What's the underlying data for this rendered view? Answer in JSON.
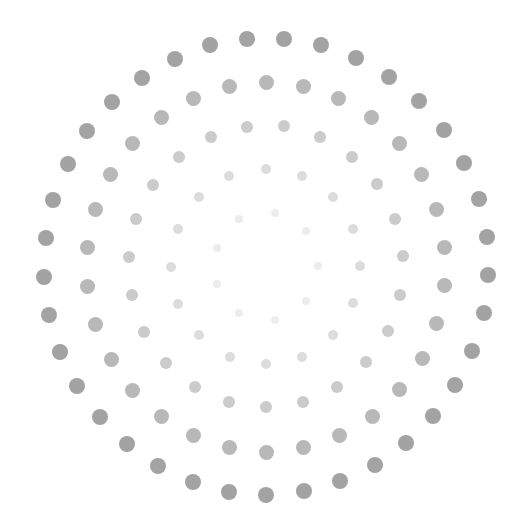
{
  "graphic": {
    "description": "Concentric rings of dots fading from dark gray (outer) to near-white (center)",
    "background": "#ffffff",
    "rings": [
      {
        "name": "ring-1",
        "size": 8,
        "color": "#ececec",
        "points": [
          [
            239,
            219
          ],
          [
            275,
            213
          ],
          [
            306,
            231
          ],
          [
            318,
            266
          ],
          [
            306,
            301
          ],
          [
            275,
            320
          ],
          [
            239,
            313
          ],
          [
            217,
            284
          ],
          [
            217,
            248
          ]
        ]
      },
      {
        "name": "ring-2",
        "size": 10,
        "color": "#dcdcdc",
        "points": [
          [
            229,
            176
          ],
          [
            266,
            169
          ],
          [
            302,
            176
          ],
          [
            333,
            197
          ],
          [
            353,
            229
          ],
          [
            360,
            266
          ],
          [
            353,
            303
          ],
          [
            333,
            335
          ],
          [
            302,
            357
          ],
          [
            266,
            364
          ],
          [
            230,
            357
          ],
          [
            199,
            335
          ],
          [
            178,
            304
          ],
          [
            171,
            267
          ],
          [
            178,
            229
          ],
          [
            199,
            197
          ]
        ]
      },
      {
        "name": "ring-3",
        "size": 12,
        "color": "#cbcbcb",
        "points": [
          [
            247,
            127
          ],
          [
            284,
            126
          ],
          [
            320,
            137
          ],
          [
            352,
            157
          ],
          [
            377,
            184
          ],
          [
            395,
            219
          ],
          [
            403,
            256
          ],
          [
            400,
            295
          ],
          [
            388,
            331
          ],
          [
            366,
            362
          ],
          [
            337,
            387
          ],
          [
            303,
            402
          ],
          [
            266,
            407
          ],
          [
            229,
            402
          ],
          [
            195,
            387
          ],
          [
            166,
            363
          ],
          [
            144,
            332
          ],
          [
            132,
            295
          ],
          [
            129,
            257
          ],
          [
            136,
            219
          ],
          [
            153,
            185
          ],
          [
            179,
            157
          ],
          [
            211,
            137
          ]
        ]
      },
      {
        "name": "ring-4",
        "size": 15,
        "color": "#b8b8b8",
        "points": [
          [
            229,
            86
          ],
          [
            266,
            82
          ],
          [
            303,
            86
          ],
          [
            338,
            98
          ],
          [
            371,
            117
          ],
          [
            399,
            143
          ],
          [
            421,
            174
          ],
          [
            436,
            209
          ],
          [
            444,
            247
          ],
          [
            444,
            285
          ],
          [
            436,
            323
          ],
          [
            422,
            358
          ],
          [
            399,
            389
          ],
          [
            372,
            416
          ],
          [
            339,
            435
          ],
          [
            303,
            447
          ],
          [
            266,
            452
          ],
          [
            229,
            447
          ],
          [
            193,
            435
          ],
          [
            161,
            416
          ],
          [
            132,
            390
          ],
          [
            111,
            359
          ],
          [
            95,
            324
          ],
          [
            87,
            286
          ],
          [
            87,
            247
          ],
          [
            95,
            209
          ],
          [
            110,
            174
          ],
          [
            132,
            143
          ],
          [
            161,
            117
          ],
          [
            193,
            98
          ]
        ]
      },
      {
        "name": "ring-5",
        "size": 16,
        "color": "#a3a3a3",
        "points": [
          [
            210,
            45
          ],
          [
            247,
            39
          ],
          [
            284,
            39
          ],
          [
            321,
            45
          ],
          [
            356,
            58
          ],
          [
            389,
            77
          ],
          [
            419,
            101
          ],
          [
            444,
            130
          ],
          [
            464,
            163
          ],
          [
            479,
            199
          ],
          [
            487,
            237
          ],
          [
            488,
            275
          ],
          [
            484,
            313
          ],
          [
            472,
            351
          ],
          [
            455,
            385
          ],
          [
            433,
            416
          ],
          [
            406,
            443
          ],
          [
            375,
            465
          ],
          [
            340,
            481
          ],
          [
            304,
            491
          ],
          [
            266,
            495
          ],
          [
            229,
            492
          ],
          [
            193,
            482
          ],
          [
            158,
            466
          ],
          [
            127,
            444
          ],
          [
            100,
            417
          ],
          [
            77,
            386
          ],
          [
            60,
            352
          ],
          [
            49,
            315
          ],
          [
            44,
            277
          ],
          [
            46,
            238
          ],
          [
            53,
            200
          ],
          [
            68,
            164
          ],
          [
            87,
            131
          ],
          [
            112,
            102
          ],
          [
            142,
            78
          ],
          [
            175,
            59
          ]
        ]
      }
    ]
  }
}
